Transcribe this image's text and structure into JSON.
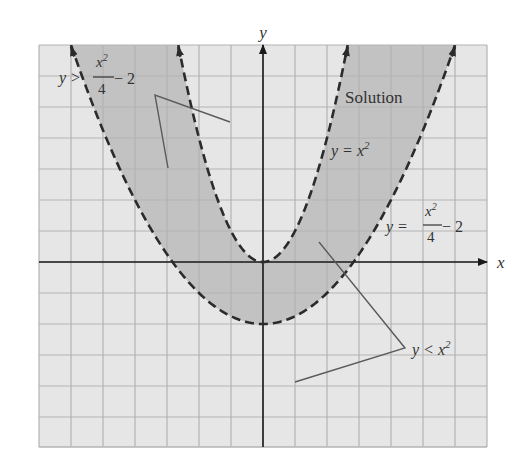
{
  "chart_data": {
    "type": "area",
    "title": "",
    "xlabel": "x",
    "ylabel": "y",
    "xlim": [
      -7,
      7
    ],
    "ylim": [
      -6,
      7
    ],
    "grid": true,
    "grid_step": 1,
    "series": [
      {
        "name": "y = x^2",
        "function": "x^2",
        "style": "dashed",
        "color": "#2b2b2b"
      },
      {
        "name": "y = x^2/4 - 2",
        "function": "x^2/4 - 2",
        "style": "dashed",
        "color": "#2b2b2b"
      }
    ],
    "shaded_region": {
      "name": "Solution",
      "description": "x^2/4 - 2 < y < x^2",
      "color": "#c2c2c2"
    },
    "annotations": {
      "solution": "Solution",
      "curve_upper": {
        "lhs": "y = ",
        "base": "x",
        "exp": "2"
      },
      "curve_lower": {
        "lhs": "y = ",
        "num_base": "x",
        "num_exp": "2",
        "den": "4",
        "tail": " − 2"
      },
      "ineq_upper": {
        "lhs": "y > ",
        "num_base": "x",
        "num_exp": "2",
        "den": "4",
        "tail": " − 2"
      },
      "ineq_lower": {
        "lhs": "y < ",
        "base": "x",
        "exp": "2"
      }
    },
    "colors": {
      "background": "#e6e6e6",
      "grid": "#b3b3b3",
      "axis": "#1a1a1a",
      "shade": "#c2c2c2",
      "leader": "#5a5a5a"
    }
  }
}
